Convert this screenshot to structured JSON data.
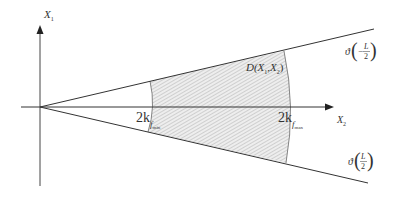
{
  "diagram": {
    "title": "",
    "axes": {
      "vertical": {
        "label": "X",
        "subscript": "1"
      },
      "horizontal": {
        "label": "X",
        "subscript": "2"
      }
    },
    "region": {
      "label": "D(X",
      "label_sub1": "1",
      "label_mid": ",X",
      "label_sub2": "2",
      "label_end": ")"
    },
    "inner_boundary": {
      "coef": "2k",
      "sub": "f",
      "subsub": "min"
    },
    "outer_boundary": {
      "coef": "2k",
      "sub": "f",
      "subsub": "max"
    },
    "upper_ray": {
      "func": "ϑ",
      "open": "(",
      "sign": "−",
      "num": "L",
      "den": "2",
      "close": ")"
    },
    "lower_ray": {
      "func": "ϑ",
      "open": "(",
      "sign": "",
      "num": "L",
      "den": "2",
      "close": ")"
    },
    "colors": {
      "line": "#333333",
      "hatch": "#9a9a9a",
      "background": "#ffffff"
    }
  }
}
